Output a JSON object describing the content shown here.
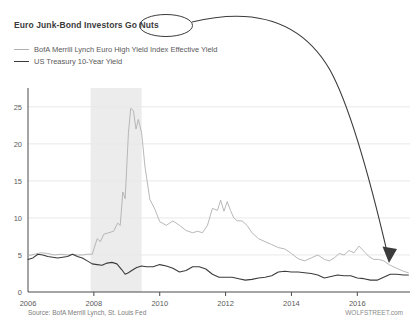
{
  "title": "Euro Junk-Bond Investors Go Nuts",
  "annotation": {
    "circled_text": "Go Nuts",
    "ellipse_label": "circle-annotation",
    "arrow_label": "curved-arrow-annotation",
    "color": "#3b3b3b"
  },
  "source_note": "Source: BofA Merrill Lynch, St. Louis Fed",
  "watermark": "WOLFSTREET.com",
  "colors": {
    "junk_series": "#b0b0b0",
    "treasury_series": "#3b3b3b",
    "grid": "#e8e8e8",
    "axis": "#4a4a4a",
    "recession_band": "#ececec",
    "text": "#5a5a5a"
  },
  "chart_data": {
    "type": "line",
    "title": "Euro Junk-Bond Investors Go Nuts",
    "xlabel": "",
    "ylabel": "",
    "xlim": [
      2006.0,
      2017.6
    ],
    "ylim": [
      0,
      27
    ],
    "yticks": [
      0,
      5,
      10,
      15,
      20,
      25
    ],
    "xticks": [
      2006,
      2008,
      2010,
      2012,
      2014,
      2016
    ],
    "grid": true,
    "legend_position": "top-left",
    "shaded_regions": [
      {
        "name": "recession-band",
        "x0": 2007.9,
        "x1": 2009.45
      }
    ],
    "series": [
      {
        "name": "BofA Merrill Lynch Euro High Yield Index Effective Yield",
        "color": "#b0b0b0",
        "x": [
          2006.0,
          2006.2,
          2006.4,
          2006.6,
          2006.8,
          2007.0,
          2007.2,
          2007.35,
          2007.5,
          2007.65,
          2007.8,
          2007.95,
          2008.1,
          2008.2,
          2008.3,
          2008.45,
          2008.6,
          2008.72,
          2008.8,
          2008.88,
          2008.95,
          2009.0,
          2009.05,
          2009.12,
          2009.2,
          2009.28,
          2009.35,
          2009.45,
          2009.55,
          2009.7,
          2009.85,
          2010.0,
          2010.2,
          2010.4,
          2010.6,
          2010.8,
          2011.0,
          2011.15,
          2011.3,
          2011.45,
          2011.6,
          2011.75,
          2011.85,
          2011.95,
          2012.05,
          2012.15,
          2012.25,
          2012.35,
          2012.5,
          2012.65,
          2012.8,
          2013.0,
          2013.2,
          2013.4,
          2013.6,
          2013.8,
          2014.0,
          2014.2,
          2014.4,
          2014.6,
          2014.8,
          2015.0,
          2015.15,
          2015.3,
          2015.45,
          2015.6,
          2015.75,
          2015.9,
          2016.05,
          2016.2,
          2016.35,
          2016.5,
          2016.65,
          2016.8,
          2017.0,
          2017.2,
          2017.4,
          2017.55
        ],
        "values": [
          4.9,
          5.1,
          5.3,
          5.2,
          5.0,
          5.1,
          5.0,
          5.1,
          5.0,
          5.0,
          5.1,
          5.1,
          7.2,
          6.8,
          7.8,
          8.0,
          8.2,
          9.3,
          9.0,
          13.5,
          12.6,
          17.0,
          21.5,
          24.8,
          24.5,
          22.0,
          23.3,
          21.5,
          17.0,
          12.5,
          11.2,
          9.5,
          9.0,
          9.6,
          9.0,
          8.3,
          8.0,
          8.2,
          8.0,
          9.0,
          11.3,
          11.0,
          12.4,
          10.9,
          12.2,
          11.0,
          10.0,
          9.6,
          9.6,
          9.0,
          8.0,
          7.2,
          6.8,
          6.4,
          6.0,
          5.8,
          5.2,
          4.5,
          4.2,
          4.6,
          5.0,
          4.4,
          4.2,
          4.6,
          5.2,
          5.0,
          5.6,
          5.3,
          6.2,
          5.5,
          4.8,
          4.4,
          4.4,
          4.2,
          3.6,
          3.2,
          2.8,
          2.6
        ]
      },
      {
        "name": "US Treasury 10-Year Yield",
        "color": "#3b3b3b",
        "x": [
          2006.0,
          2006.15,
          2006.3,
          2006.45,
          2006.6,
          2006.75,
          2006.9,
          2007.05,
          2007.2,
          2007.35,
          2007.5,
          2007.65,
          2007.8,
          2007.95,
          2008.1,
          2008.25,
          2008.4,
          2008.55,
          2008.7,
          2008.85,
          2008.95,
          2009.05,
          2009.15,
          2009.3,
          2009.45,
          2009.6,
          2009.8,
          2010.0,
          2010.2,
          2010.4,
          2010.6,
          2010.8,
          2011.0,
          2011.2,
          2011.4,
          2011.6,
          2011.8,
          2012.0,
          2012.2,
          2012.4,
          2012.6,
          2012.8,
          2013.0,
          2013.2,
          2013.4,
          2013.6,
          2013.8,
          2014.0,
          2014.2,
          2014.4,
          2014.6,
          2014.8,
          2015.0,
          2015.2,
          2015.4,
          2015.6,
          2015.8,
          2016.0,
          2016.2,
          2016.4,
          2016.6,
          2016.8,
          2017.0,
          2017.2,
          2017.4,
          2017.55
        ],
        "values": [
          4.4,
          4.6,
          5.1,
          5.0,
          4.8,
          4.7,
          4.6,
          4.7,
          4.8,
          5.1,
          4.8,
          4.6,
          4.2,
          3.8,
          3.7,
          3.6,
          3.9,
          4.0,
          3.8,
          3.0,
          2.4,
          2.6,
          2.9,
          3.3,
          3.5,
          3.4,
          3.4,
          3.7,
          3.5,
          3.2,
          2.7,
          2.9,
          3.4,
          3.4,
          3.1,
          2.4,
          2.0,
          2.0,
          2.0,
          1.8,
          1.6,
          1.7,
          1.9,
          2.0,
          2.2,
          2.7,
          2.8,
          2.7,
          2.7,
          2.6,
          2.5,
          2.3,
          1.9,
          2.1,
          2.3,
          2.2,
          2.2,
          1.9,
          1.8,
          1.6,
          1.6,
          2.0,
          2.4,
          2.4,
          2.3,
          2.3
        ]
      }
    ]
  }
}
